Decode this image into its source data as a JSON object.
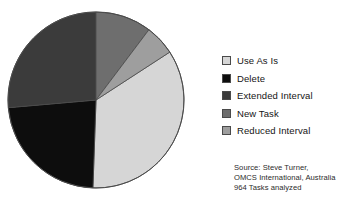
{
  "chart_data": {
    "type": "pie",
    "title": "",
    "subtitle": "",
    "xlabel": "",
    "ylabel": "",
    "legend_position": "right",
    "grid": false,
    "total_label": "964 Tasks analyzed",
    "categories": [
      "Use As Is",
      "Delete",
      "Extended Interval",
      "New Task",
      "Reduced Interval"
    ],
    "values": [
      34.7,
      23.1,
      26.4,
      10.3,
      5.5
    ],
    "units": "percent",
    "start_angle_deg": 0,
    "direction": "clockwise",
    "slices": [
      {
        "label": "Use As Is",
        "value": 34.7,
        "color": "#d6d6d6",
        "start_angle_deg": 57,
        "end_angle_deg": 182
      },
      {
        "label": "Delete",
        "value": 23.1,
        "color": "#0d0d0d",
        "start_angle_deg": 182,
        "end_angle_deg": 265
      },
      {
        "label": "Extended Interval",
        "value": 26.4,
        "color": "#3b3b3b",
        "start_angle_deg": 265,
        "end_angle_deg": 360
      },
      {
        "label": "New Task",
        "value": 10.3,
        "color": "#6e6e6e",
        "start_angle_deg": 0,
        "end_angle_deg": 37
      },
      {
        "label": "Reduced Interval",
        "value": 5.5,
        "color": "#9e9e9e",
        "start_angle_deg": 37,
        "end_angle_deg": 57
      }
    ],
    "geometry": {
      "center_x": 90,
      "center_y": 91,
      "radius": 88,
      "outline_color": "#4a4a4a"
    }
  },
  "legend": {
    "items": [
      {
        "label": "Use As Is",
        "color": "#d6d6d6"
      },
      {
        "label": "Delete",
        "color": "#0d0d0d"
      },
      {
        "label": "Extended Interval",
        "color": "#3b3b3b"
      },
      {
        "label": "New Task",
        "color": "#6e6e6e"
      },
      {
        "label": "Reduced Interval",
        "color": "#9e9e9e"
      }
    ]
  },
  "source": {
    "lines": [
      "Source: Steve Turner,",
      "OMCS International, Australia",
      "964 Tasks analyzed"
    ]
  }
}
